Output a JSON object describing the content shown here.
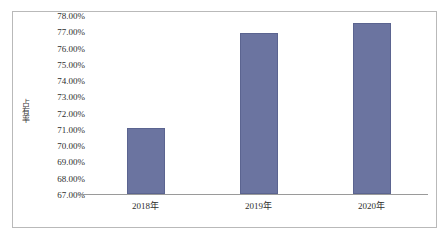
{
  "chart_data": {
    "type": "bar",
    "title": "",
    "subtitle": "",
    "xlabel": "",
    "ylabel": "占有率",
    "categories": [
      "2018年",
      "2019年",
      "2020年"
    ],
    "values": [
      71.05,
      76.87,
      77.52
    ],
    "value_labels": [
      "71.05%",
      "76.87%",
      "77.52%"
    ],
    "ylim": [
      67.0,
      78.0
    ],
    "y_tick_values": [
      78.0,
      77.0,
      76.0,
      75.0,
      74.0,
      73.0,
      72.0,
      71.0,
      70.0,
      69.0,
      68.0,
      67.0
    ],
    "y_tick_labels": [
      "78.00%",
      "77.00%",
      "76.00%",
      "75.00%",
      "74.00%",
      "73.00%",
      "72.00%",
      "71.00%",
      "70.00%",
      "69.00%",
      "68.00%",
      "67.00%"
    ],
    "grid": false,
    "legend": false,
    "legend_position": "none",
    "series": [
      {
        "name": "占有率",
        "values": [
          71.05,
          76.87,
          77.52
        ],
        "color": "#6b74a0"
      }
    ],
    "colors": {
      "bar_fill": "#6b74a0",
      "bar_stroke": "#5b6490",
      "axis_line": "#9a9a9a",
      "frame_border": "#b9b9b9",
      "text": "#2e2e2e",
      "background": "#ffffff"
    }
  }
}
